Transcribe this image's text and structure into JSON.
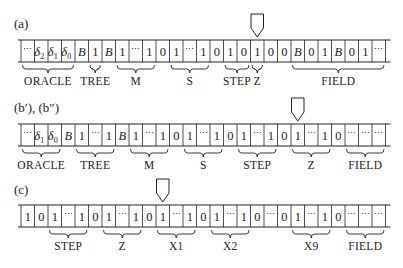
{
  "diagram": {
    "cell_width": 13.5,
    "tape_left": 21,
    "stroke_color": "#222222",
    "rows": [
      {
        "id": "a",
        "label": "(a)",
        "label_pos": [
          14,
          28
        ],
        "tape_top": 40,
        "tape_height": 22,
        "pointer_cell": 17,
        "cells": [
          "⋯",
          "δ2",
          "δ1",
          "δ0",
          "B",
          "1",
          "B",
          "1",
          "⋯",
          "1",
          "0",
          "1",
          "⋯",
          "1",
          "0",
          "1",
          "0",
          "1",
          "0",
          "0",
          "B",
          "0",
          "1",
          "B",
          "0",
          "1",
          "⋯"
        ],
        "groups": [
          {
            "label": "ORACLE",
            "from": 0,
            "to": 3
          },
          {
            "label": "TREE",
            "from": 5,
            "to": 5
          },
          {
            "label": "M",
            "from": 7,
            "to": 9
          },
          {
            "label": "S",
            "from": 11,
            "to": 13
          },
          {
            "label": "STEP",
            "from": 15,
            "to": 16
          },
          {
            "label": "Z",
            "from": 17,
            "to": 17
          },
          {
            "label": "FIELD",
            "from": 20,
            "to": 26
          }
        ]
      },
      {
        "id": "b",
        "label": "(b′), (b″)",
        "label_pos": [
          14,
          112
        ],
        "tape_top": 124,
        "tape_height": 22,
        "pointer_cell": 20,
        "cells": [
          "⋯",
          "δ1",
          "δ0",
          "B",
          "1",
          "⋯",
          "1",
          "B",
          "1",
          "⋯",
          "1",
          "0",
          "1",
          "⋯",
          "1",
          "0",
          "1",
          "⋯",
          "1",
          "0",
          "1",
          "⋯",
          "1",
          "0",
          "⋯",
          "⋯",
          "⋯"
        ],
        "groups": [
          {
            "label": "ORACLE",
            "from": 0,
            "to": 2
          },
          {
            "label": "TREE",
            "from": 4,
            "to": 6
          },
          {
            "label": "M",
            "from": 8,
            "to": 10
          },
          {
            "label": "S",
            "from": 12,
            "to": 14
          },
          {
            "label": "STEP",
            "from": 16,
            "to": 18
          },
          {
            "label": "Z",
            "from": 20,
            "to": 22
          },
          {
            "label": "FIELD",
            "from": 24,
            "to": 26
          }
        ]
      },
      {
        "id": "c",
        "label": "(c)",
        "label_pos": [
          14,
          194
        ],
        "tape_top": 205,
        "tape_height": 22,
        "pointer_cell": 10,
        "cells": [
          "1",
          "0",
          "1",
          "⋯",
          "1",
          "0",
          "1",
          "⋯",
          "1",
          "0",
          "1",
          "⋯",
          "1",
          "0",
          "1",
          "⋯",
          "1",
          "0",
          "⋯",
          "0",
          "1",
          "⋯",
          "1",
          "0",
          "⋯",
          "⋯",
          "⋯"
        ],
        "groups": [
          {
            "label": "STEP",
            "from": 2,
            "to": 4
          },
          {
            "label": "Z",
            "from": 6,
            "to": 8
          },
          {
            "label": "X1",
            "from": 10,
            "to": 12
          },
          {
            "label": "X2",
            "from": 14,
            "to": 16
          },
          {
            "label": "X9",
            "from": 20,
            "to": 22
          },
          {
            "label": "FIELD",
            "from": 24,
            "to": 26
          }
        ]
      }
    ]
  }
}
